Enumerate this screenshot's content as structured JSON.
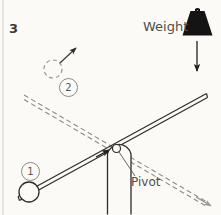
{
  "figure": {
    "number": "3",
    "background_color": "#fbfaf7",
    "ink_color": "#3a3936"
  },
  "labels": {
    "weight": "Weight",
    "pivot": "Pivot",
    "step_one": "1",
    "step_two": "2"
  },
  "elements": {
    "weight_block": {
      "name": "weight",
      "shape": "trapezoid-with-handle",
      "fill": "#141414",
      "x": 183,
      "y": 5,
      "width": 30,
      "height": 31
    },
    "weight_arrow": {
      "name": "downward-force-arrow",
      "direction": "down",
      "from_x": 197,
      "from_y": 41,
      "to_x": 197,
      "to_y": 76
    },
    "lever_beam": {
      "name": "lever-beam",
      "style": "solid-double-line",
      "left_x": 18,
      "left_y": 199,
      "right_x": 206,
      "right_y": 95
    },
    "ghost_beam": {
      "name": "previous-beam-position",
      "style": "dashed-double-line",
      "left_x": 24,
      "left_y": 96,
      "right_x": 210,
      "right_y": 205,
      "arrow_at": "right-end"
    },
    "pivot_post": {
      "name": "pivot-post",
      "x": 107,
      "y": 142,
      "width": 24,
      "height": 73
    },
    "pivot_point": {
      "name": "pivot-point",
      "cx": 116,
      "cy": 149,
      "r": 4
    },
    "ball": {
      "name": "load-ball",
      "cx": 29,
      "cy": 192,
      "r": 10
    },
    "ghost_ball": {
      "name": "ball-launched-ghost",
      "cx": 53,
      "cy": 69,
      "r": 9,
      "style": "dashed"
    },
    "launch_arrow": {
      "name": "ball-trajectory-arrow",
      "from_x": 60,
      "from_y": 62,
      "to_x": 76,
      "to_y": 48
    },
    "beam_impulse_arrow": {
      "name": "beam-impulse-arrow",
      "points_toward": "pivot",
      "tip_x": 108,
      "tip_y": 150
    },
    "pivot_leader_line": {
      "name": "pivot-leader-line",
      "from_x": 119,
      "from_y": 152,
      "to_x": 134,
      "to_y": 175
    },
    "page_edge": {
      "name": "page-edge-line",
      "x": 3
    }
  }
}
